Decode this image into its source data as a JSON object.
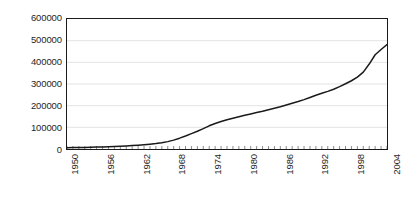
{
  "chart_data": {
    "type": "line",
    "title": "",
    "subtitle": "",
    "xlabel": "",
    "ylabel": "",
    "xlim": [
      1950,
      2004
    ],
    "ylim": [
      0,
      600000
    ],
    "grid": true,
    "grid_axis": "y",
    "legend": false,
    "legend_position": "none",
    "line_color": "#1a1a1a",
    "axis_color": "#1a1a1a",
    "gridline_color": "#e3e3e3",
    "yticks": [
      0,
      100000,
      200000,
      300000,
      400000,
      500000,
      600000
    ],
    "ytick_labels": [
      "0",
      "100000",
      "200000",
      "300000",
      "400000",
      "500000",
      "600000"
    ],
    "xtick_labels": [
      "1950",
      "1956",
      "1962",
      "1968",
      "1974",
      "1980",
      "1986",
      "1992",
      "1998",
      "2004"
    ],
    "xticks": [
      1950,
      1956,
      1962,
      1968,
      1974,
      1980,
      1986,
      1992,
      1998,
      2004
    ],
    "xtick_rotation": -90,
    "x": [
      1950,
      1951,
      1952,
      1953,
      1954,
      1955,
      1956,
      1957,
      1958,
      1959,
      1960,
      1961,
      1962,
      1963,
      1964,
      1965,
      1966,
      1967,
      1968,
      1969,
      1970,
      1971,
      1972,
      1973,
      1974,
      1975,
      1976,
      1977,
      1978,
      1979,
      1980,
      1981,
      1982,
      1983,
      1984,
      1985,
      1986,
      1987,
      1988,
      1989,
      1990,
      1991,
      1992,
      1993,
      1994,
      1995,
      1996,
      1997,
      1998,
      1999,
      2000,
      2001,
      2002,
      2003,
      2004
    ],
    "series": [
      {
        "name": "",
        "values": [
          6000,
          6400,
          6900,
          7400,
          8000,
          8700,
          9500,
          10400,
          11400,
          12600,
          14000,
          15600,
          17400,
          19500,
          22000,
          25000,
          29000,
          34000,
          41000,
          50000,
          60000,
          71000,
          82000,
          94000,
          107000,
          118000,
          127000,
          135000,
          142000,
          149000,
          156000,
          162000,
          168000,
          174000,
          181000,
          188000,
          195000,
          203000,
          211000,
          219000,
          228000,
          238000,
          248000,
          257000,
          266000,
          276000,
          288000,
          301000,
          315000,
          332000,
          355000,
          392000,
          435000,
          459000,
          482000
        ]
      }
    ]
  }
}
